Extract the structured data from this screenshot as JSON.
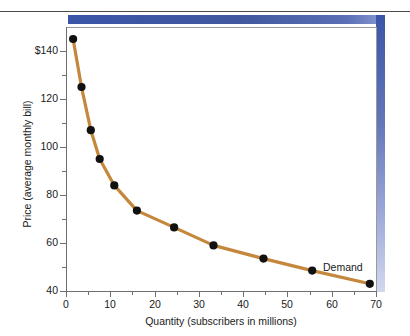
{
  "chart_data": {
    "type": "line",
    "title": "",
    "subtitle": "",
    "xlabel": "Quantity (subscribers in millions)",
    "ylabel": "Price (average monthly bill)",
    "xlim": [
      0,
      70
    ],
    "ylim": [
      40,
      150
    ],
    "grid": false,
    "legend_position": "inline-annotation",
    "series": [
      {
        "name": "Demand",
        "color": "#c4873c",
        "marker": "filled-circle",
        "marker_color": "#111111",
        "x": [
          1.6,
          3.5,
          5.6,
          7.6,
          10.9,
          16.0,
          24.4,
          33.3,
          44.6,
          55.6,
          68.6
        ],
        "y": [
          145.0,
          125.0,
          107.0,
          95.0,
          84.0,
          73.5,
          66.5,
          59.0,
          53.5,
          48.5,
          43.0
        ]
      }
    ],
    "annotations": [
      {
        "text": "Demand",
        "x": 58.0,
        "y": 52.5
      }
    ],
    "x_ticks_major": [
      0,
      10,
      20,
      30,
      40,
      50,
      60,
      70
    ],
    "x_tick_labels": [
      "0",
      "10",
      "20",
      "30",
      "40",
      "50",
      "60",
      "70"
    ],
    "x_ticks_minor": [
      5,
      15,
      25,
      35,
      45,
      55,
      65
    ],
    "y_ticks_major": [
      40,
      60,
      80,
      100,
      120,
      140
    ],
    "y_tick_labels": [
      "40",
      "60",
      "80",
      "100",
      "120",
      "$140"
    ],
    "y_ticks_minor": [
      50,
      70,
      90,
      110,
      130
    ]
  },
  "decor": {
    "top_bar_color": "#3b55a8",
    "right_bar_color": "#3b55a8",
    "rule_color": "#4a4a4a"
  }
}
